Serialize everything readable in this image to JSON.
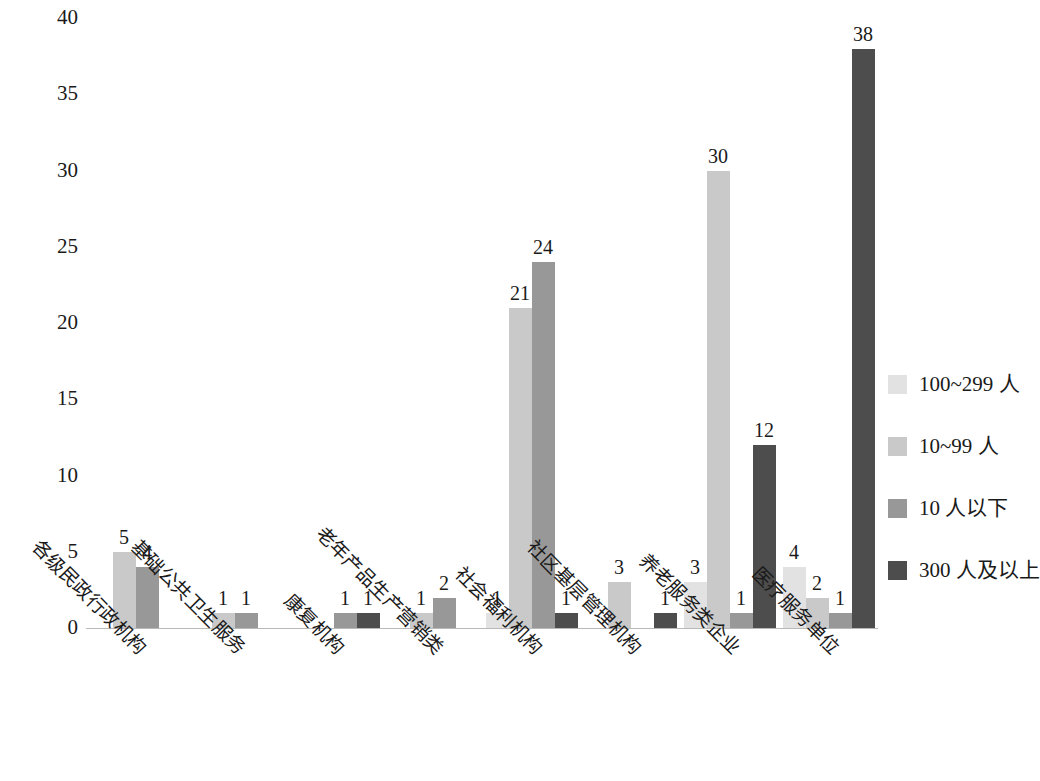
{
  "chart_data": {
    "type": "bar",
    "title": "",
    "subtitle": "",
    "xlabel": "",
    "ylabel": "",
    "ylim": [
      0,
      40
    ],
    "ytick_step": 5,
    "yticks": [
      "40",
      "35",
      "30",
      "25",
      "20",
      "15",
      "10",
      "5",
      "0"
    ],
    "grid": false,
    "legend_position": "right",
    "categories": [
      "各级民政行政机构",
      "基础公共卫生服务",
      "康复机构",
      "老年产品生产营销类",
      "社会福利机构",
      "社区基层管理机构",
      "养老服务类企业",
      "医疗服务单位"
    ],
    "series": [
      {
        "name": "100~299 人",
        "color": "#e2e2e2",
        "values": [
          null,
          null,
          null,
          null,
          1,
          null,
          3,
          4
        ]
      },
      {
        "name": "10~99 人",
        "color": "#c9c9c9",
        "values": [
          5,
          1,
          null,
          1,
          21,
          3,
          30,
          2
        ]
      },
      {
        "name": "10 人以下",
        "color": "#989898",
        "values": [
          4,
          1,
          1,
          2,
          24,
          null,
          1,
          1
        ]
      },
      {
        "name": "300 人及以上",
        "color": "#4d4d4d",
        "values": [
          null,
          null,
          1,
          null,
          1,
          1,
          12,
          38
        ]
      }
    ],
    "data_labels": [
      [
        "",
        "5",
        "4",
        ""
      ],
      [
        "",
        "1",
        "1",
        ""
      ],
      [
        "",
        "",
        "1",
        "1"
      ],
      [
        "",
        "1",
        "2",
        ""
      ],
      [
        "1",
        "21",
        "24",
        "1"
      ],
      [
        "",
        "3",
        "",
        "1"
      ],
      [
        "3",
        "30",
        "1",
        "12"
      ],
      [
        "4",
        "2",
        "1",
        "38"
      ]
    ]
  },
  "legend": {
    "items": [
      {
        "label": "100~299 人",
        "color": "#e2e2e2"
      },
      {
        "label": "10~99 人",
        "color": "#c9c9c9"
      },
      {
        "label": "10 人以下",
        "color": "#989898"
      },
      {
        "label": "300 人及以上",
        "color": "#4d4d4d"
      }
    ]
  },
  "axis": {
    "y_labels": [
      "40",
      "35",
      "30",
      "25",
      "20",
      "15",
      "10",
      "5",
      "0"
    ]
  }
}
